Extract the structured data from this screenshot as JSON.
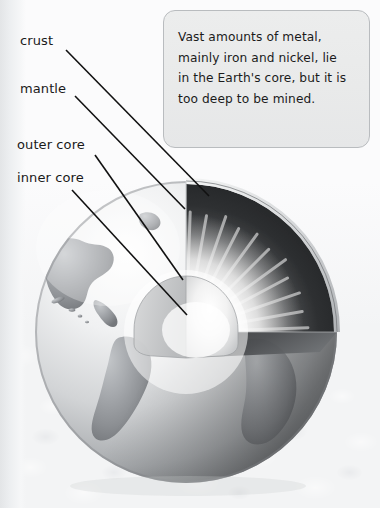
{
  "page": {
    "background_color": "#f3f4f5",
    "width": 380,
    "height": 508
  },
  "callout": {
    "text": "Vast amounts of metal,\nmainly iron and nickel, lie\nin the Earth's core, but it is\ntoo deep to be mined.",
    "border_color": "#b9bcbf",
    "fill_color": "#eaebec",
    "text_color": "#1b1b1b"
  },
  "labels": [
    {
      "id": "crust",
      "text": "crust",
      "x": 20,
      "y": 33
    },
    {
      "id": "mantle",
      "text": "mantle",
      "x": 20,
      "y": 81
    },
    {
      "id": "outer-core",
      "text": "outer core",
      "x": 17,
      "y": 137
    },
    {
      "id": "inner-core",
      "text": "inner core",
      "x": 17,
      "y": 170
    }
  ],
  "leader_lines": [
    {
      "id": "crust-leader",
      "x1": 66,
      "y1": 50,
      "x2": 209,
      "y2": 196,
      "color": "#111111"
    },
    {
      "id": "mantle-leader",
      "x1": 75,
      "y1": 96,
      "x2": 185,
      "y2": 209,
      "color": "#111111"
    },
    {
      "id": "outer-core-leader",
      "x1": 95,
      "y1": 155,
      "x2": 183,
      "y2": 280,
      "color": "#111111"
    },
    {
      "id": "inner-core-leader",
      "x1": 72,
      "y1": 190,
      "x2": 187,
      "y2": 315,
      "color": "#111111"
    }
  ],
  "diagram": {
    "globe": {
      "center_x": 186,
      "center_y": 332,
      "radius": 151,
      "ocean_color": "#e7e8ea",
      "land_color": "#9a9da0",
      "shadow_color": "#6f7275"
    },
    "layers": [
      {
        "name": "crust",
        "description": "thin outer shell visible along the cutaway rim",
        "color": "#cfd1d3"
      },
      {
        "name": "mantle",
        "description": "dark grey band beneath the crust",
        "color": "#3b3d40"
      },
      {
        "name": "outer core",
        "description": "bright radiant zone with streaking rays",
        "color": "#f2f2f2"
      },
      {
        "name": "inner core",
        "description": "small rounded wedge at the centre, brightest",
        "color": "#fbfbfb"
      }
    ],
    "cutaway": {
      "description": "a three-quarter wedge removed from the upper-right of the sphere revealing concentric interior layers",
      "wedge_opening_deg": 90
    }
  }
}
